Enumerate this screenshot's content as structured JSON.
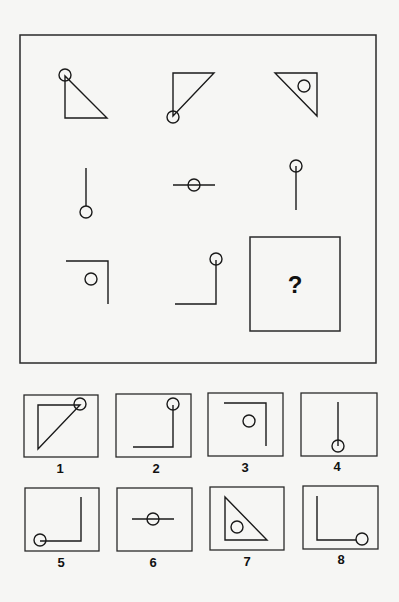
{
  "puzzle": {
    "frame": {
      "x": 20,
      "y": 35,
      "w": 356,
      "h": 328
    },
    "cells": [
      {
        "id": "r1c1",
        "name": "triangle-circle-top-vertex",
        "shapes": [
          {
            "type": "polygon",
            "points": "65,76 65,118 107,118"
          },
          {
            "type": "circle",
            "cx": 65,
            "cy": 75,
            "r": 6
          }
        ]
      },
      {
        "id": "r1c2",
        "name": "triangle-circle-bottom-vertex",
        "shapes": [
          {
            "type": "polygon",
            "points": "173,73 214,73 173,116"
          },
          {
            "type": "circle",
            "cx": 173,
            "cy": 117,
            "r": 6
          }
        ]
      },
      {
        "id": "r1c3",
        "name": "triangle-circle-inside",
        "shapes": [
          {
            "type": "polygon",
            "points": "275,73 317,73 317,116"
          },
          {
            "type": "circle",
            "cx": 304,
            "cy": 86,
            "r": 6
          }
        ]
      },
      {
        "id": "r2c1",
        "name": "line-circle-bottom",
        "shapes": [
          {
            "type": "line",
            "x1": 86,
            "y1": 168,
            "x2": 86,
            "y2": 206
          },
          {
            "type": "circle",
            "cx": 86,
            "cy": 212,
            "r": 6
          }
        ]
      },
      {
        "id": "r2c2",
        "name": "line-circle-middle",
        "shapes": [
          {
            "type": "line",
            "x1": 173,
            "y1": 185,
            "x2": 215,
            "y2": 185
          },
          {
            "type": "circle",
            "cx": 194,
            "cy": 185,
            "r": 6
          }
        ]
      },
      {
        "id": "r2c3",
        "name": "line-circle-top",
        "shapes": [
          {
            "type": "line",
            "x1": 296,
            "y1": 166,
            "x2": 296,
            "y2": 210
          },
          {
            "type": "circle",
            "cx": 296,
            "cy": 166,
            "r": 6
          }
        ]
      },
      {
        "id": "r3c1",
        "name": "corner-circle-inside",
        "shapes": [
          {
            "type": "polyline",
            "points": "66,261 108,261 108,304"
          },
          {
            "type": "circle",
            "cx": 91,
            "cy": 279,
            "r": 6
          }
        ]
      },
      {
        "id": "r3c2",
        "name": "corner-circle-end",
        "shapes": [
          {
            "type": "polyline",
            "points": "175,304 216,304 216,260"
          },
          {
            "type": "circle",
            "cx": 216,
            "cy": 259,
            "r": 6
          }
        ]
      }
    ],
    "answer_box": {
      "x": 250,
      "y": 237,
      "w": 90,
      "h": 94,
      "text": "?",
      "tx": 295,
      "ty": 293
    }
  },
  "options": [
    {
      "label": "1",
      "box": {
        "x": 24,
        "y": 395,
        "w": 74,
        "h": 62
      },
      "lx": 60,
      "ly": 473,
      "shapes": [
        {
          "type": "polygon",
          "points": "38,405 80,405 38,449"
        },
        {
          "type": "circle",
          "cx": 80,
          "cy": 404,
          "r": 6
        }
      ]
    },
    {
      "label": "2",
      "box": {
        "x": 116,
        "y": 394,
        "w": 75,
        "h": 63
      },
      "lx": 156,
      "ly": 473,
      "shapes": [
        {
          "type": "polyline",
          "points": "133,447 173,447 173,405"
        },
        {
          "type": "circle",
          "cx": 173,
          "cy": 404,
          "r": 6
        }
      ]
    },
    {
      "label": "3",
      "box": {
        "x": 208,
        "y": 393,
        "w": 75,
        "h": 63
      },
      "lx": 245,
      "ly": 472,
      "shapes": [
        {
          "type": "polyline",
          "points": "224,403 266,403 266,446"
        },
        {
          "type": "circle",
          "cx": 249,
          "cy": 421,
          "r": 6
        }
      ]
    },
    {
      "label": "4",
      "box": {
        "x": 301,
        "y": 393,
        "w": 76,
        "h": 63
      },
      "lx": 337,
      "ly": 471,
      "shapes": [
        {
          "type": "line",
          "x1": 338,
          "y1": 402,
          "x2": 338,
          "y2": 446
        },
        {
          "type": "circle",
          "cx": 338,
          "cy": 446,
          "r": 6
        }
      ]
    },
    {
      "label": "5",
      "box": {
        "x": 25,
        "y": 488,
        "w": 74,
        "h": 63
      },
      "lx": 61,
      "ly": 567,
      "shapes": [
        {
          "type": "polyline",
          "points": "40,541 81,541 81,497"
        },
        {
          "type": "circle",
          "cx": 40,
          "cy": 540,
          "r": 6
        }
      ]
    },
    {
      "label": "6",
      "box": {
        "x": 117,
        "y": 488,
        "w": 75,
        "h": 63
      },
      "lx": 153,
      "ly": 567,
      "shapes": [
        {
          "type": "line",
          "x1": 132,
          "y1": 519,
          "x2": 174,
          "y2": 519
        },
        {
          "type": "circle",
          "cx": 153,
          "cy": 519,
          "r": 6
        }
      ]
    },
    {
      "label": "7",
      "box": {
        "x": 210,
        "y": 487,
        "w": 74,
        "h": 63
      },
      "lx": 247,
      "ly": 566,
      "shapes": [
        {
          "type": "polygon",
          "points": "225,497 225,540 267,540"
        },
        {
          "type": "circle",
          "cx": 237,
          "cy": 527,
          "r": 6
        }
      ]
    },
    {
      "label": "8",
      "box": {
        "x": 303,
        "y": 486,
        "w": 75,
        "h": 63
      },
      "lx": 341,
      "ly": 564,
      "shapes": [
        {
          "type": "polyline",
          "points": "317,496 317,540 356,540"
        },
        {
          "type": "circle",
          "cx": 362,
          "cy": 539,
          "r": 6
        }
      ]
    }
  ],
  "colors": {
    "ink": "#1a1a1a",
    "paper": "#f6f6f4"
  }
}
